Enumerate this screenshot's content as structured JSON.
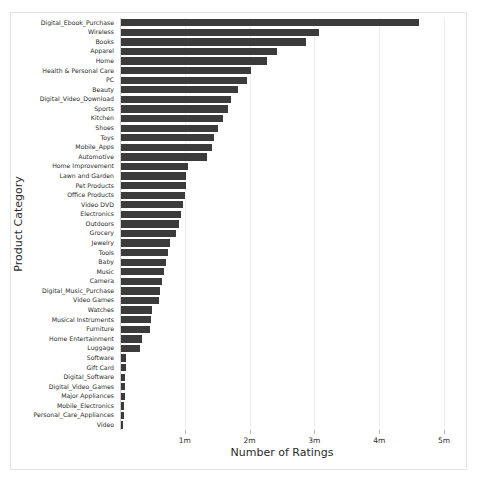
{
  "chart_data": {
    "type": "bar",
    "orientation": "horizontal",
    "title": "",
    "xlabel": "Number of Ratings",
    "ylabel": "Product Category",
    "xlim": [
      0,
      5000000
    ],
    "ylim": null,
    "grid": true,
    "legend": null,
    "bar_color": "#3b3b3b",
    "background_color": "#ffffff",
    "xtick_values": [
      1000000,
      2000000,
      3000000,
      4000000,
      5000000
    ],
    "xtick_labels": [
      "1m",
      "2m",
      "3m",
      "4m",
      "5m"
    ],
    "categories": [
      "Digital_Ebook_Purchase",
      "Wireless",
      "Books",
      "Apparel",
      "Home",
      "Health & Personal Care",
      "PC",
      "Beauty",
      "Digital_Video_Download",
      "Sports",
      "Kitchen",
      "Shoes",
      "Toys",
      "Mobile_Apps",
      "Automotive",
      "Home Improvement",
      "Lawn and Garden",
      "Pet Products",
      "Office Products",
      "Video DVD",
      "Electronics",
      "Outdoors",
      "Grocery",
      "Jewelry",
      "Tools",
      "Baby",
      "Music",
      "Camera",
      "Digital_Music_Purchase",
      "Video Games",
      "Watches",
      "Musical Instruments",
      "Furniture",
      "Home Entertainment",
      "Luggage",
      "Software",
      "Gift Card",
      "Digital_Software",
      "Digital_Video_Games",
      "Major Appliances",
      "Mobile_Electronics",
      "Personal_Care_Appliances",
      "Video"
    ],
    "values": [
      4600000,
      3050000,
      2850000,
      2400000,
      2250000,
      2000000,
      1950000,
      1800000,
      1700000,
      1650000,
      1570000,
      1500000,
      1430000,
      1400000,
      1330000,
      1030000,
      1010000,
      1000000,
      980000,
      960000,
      930000,
      900000,
      850000,
      760000,
      730000,
      700000,
      670000,
      640000,
      600000,
      580000,
      480000,
      460000,
      450000,
      320000,
      290000,
      80000,
      70000,
      65000,
      60000,
      55000,
      45000,
      40000,
      30000
    ]
  }
}
